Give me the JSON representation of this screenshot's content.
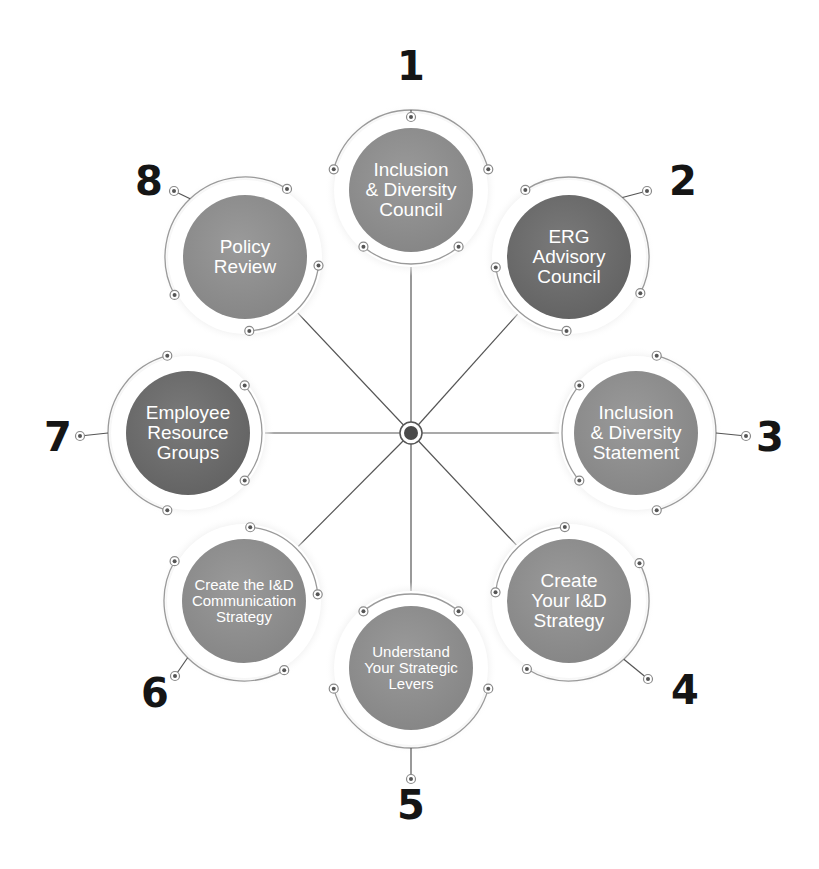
{
  "diagram": {
    "type": "radial-hub",
    "center": {
      "x": 411,
      "y": 433
    },
    "colors": {
      "disk_light": "#8f8f8f",
      "disk_dark": "#6e6e6e",
      "ring": "#9a9a9a",
      "spoke": "#555555",
      "hub": "#4a4a4a",
      "number": "#151515",
      "label_text": "#ffffff"
    },
    "nodes": [
      {
        "number": "1",
        "lines": [
          "Inclusion",
          "& Diversity",
          "Council"
        ],
        "shade": "light",
        "cx": 411,
        "cy": 190,
        "num_x": 411,
        "num_y": 66,
        "dot_x": 411,
        "dot_y": 117
      },
      {
        "number": "2",
        "lines": [
          "ERG",
          "Advisory",
          "Council"
        ],
        "shade": "dark",
        "cx": 569,
        "cy": 257,
        "num_x": 683,
        "num_y": 181,
        "dot_x": 647,
        "dot_y": 191
      },
      {
        "number": "3",
        "lines": [
          "Inclusion",
          "& Diversity",
          "Statement"
        ],
        "shade": "light",
        "cx": 636,
        "cy": 433,
        "num_x": 770,
        "num_y": 437,
        "dot_x": 746,
        "dot_y": 436
      },
      {
        "number": "4",
        "lines": [
          "Create",
          "Your I&D",
          "Strategy"
        ],
        "shade": "light",
        "cx": 569,
        "cy": 601,
        "num_x": 685,
        "num_y": 690,
        "dot_x": 648,
        "dot_y": 679
      },
      {
        "number": "5",
        "lines": [
          "Understand",
          "Your Strategic",
          "Levers"
        ],
        "shade": "light",
        "cx": 411,
        "cy": 668,
        "num_x": 411,
        "num_y": 805,
        "dot_x": 411,
        "dot_y": 779
      },
      {
        "number": "6",
        "lines": [
          "Create the I&D",
          "Communication",
          "Strategy"
        ],
        "shade": "light",
        "cx": 244,
        "cy": 601,
        "num_x": 155,
        "num_y": 693,
        "dot_x": 175,
        "dot_y": 676
      },
      {
        "number": "7",
        "lines": [
          "Employee",
          "Resource",
          "Groups"
        ],
        "shade": "dark",
        "cx": 188,
        "cy": 433,
        "num_x": 58,
        "num_y": 437,
        "dot_x": 80,
        "dot_y": 436
      },
      {
        "number": "8",
        "lines": [
          "Policy",
          "Review"
        ],
        "shade": "light",
        "cx": 245,
        "cy": 257,
        "num_x": 149,
        "num_y": 181,
        "dot_x": 174,
        "dot_y": 191
      }
    ],
    "disk_radius": 62,
    "ring_radius": 80
  }
}
